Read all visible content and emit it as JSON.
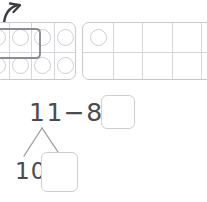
{
  "worksheet": {
    "title": "Subtraction with ten frames",
    "arrow_icon": "curved-arrow-up-right-icon"
  },
  "ten_frames": [
    {
      "name": "left-ten-frame",
      "columns": 5,
      "rows": 2,
      "filled_count": 6,
      "selection_outline": true,
      "clipped_left": true
    },
    {
      "name": "right-ten-frame",
      "columns": 5,
      "rows": 2,
      "filled_count": 1,
      "selection_outline": false,
      "clipped_right": true
    }
  ],
  "equation": {
    "minuend": "11",
    "operator": "−",
    "subtrahend": "8",
    "equals": "=",
    "expression": "11−8=",
    "answer_value": "",
    "answer_placeholder": ""
  },
  "number_bond": {
    "whole": "11",
    "part_left": "10",
    "part_right_value": "",
    "part_right_placeholder": ""
  },
  "colors": {
    "ink": "#4a4a4f",
    "grid_line": "#d6d6da",
    "frame_border": "#c9c9cc",
    "dot_border": "#cfcfd4",
    "box_border": "#cdcdd2",
    "selection": "#8c8c93",
    "background": "#ffffff"
  }
}
